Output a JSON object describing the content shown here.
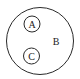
{
  "diagram": {
    "type": "euler",
    "sets": [
      {
        "id": "B",
        "label": "B",
        "contains": [
          "A",
          "C"
        ]
      },
      {
        "id": "A",
        "label": "A"
      },
      {
        "id": "C",
        "label": "C"
      }
    ],
    "relations": [
      "A ⊂ B",
      "C ⊂ B",
      "A ∩ C = ∅"
    ],
    "stroke_color": "#2a2a2a",
    "label_color": "#222222"
  }
}
